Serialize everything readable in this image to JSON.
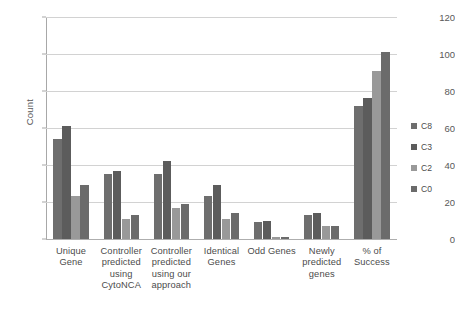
{
  "chart_data": {
    "type": "bar",
    "title": "",
    "xlabel": "",
    "ylabel": "Count",
    "ylim": [
      0,
      120
    ],
    "yticks": [
      0,
      20,
      40,
      60,
      80,
      100,
      120
    ],
    "grid": true,
    "legend_position": "right",
    "categories": [
      "Unique Gene",
      "Controller predicted using CytoNCA",
      "Controller predicted using our approach",
      "Identical Genes",
      "Odd Genes",
      "Newly predicted genes",
      "% of Success"
    ],
    "category_lines": [
      [
        "Unique",
        "Gene"
      ],
      [
        "Controller",
        "predicted",
        "using",
        "CytoNCA"
      ],
      [
        "Controller",
        "predicted",
        "using our",
        "approach"
      ],
      [
        "Identical",
        "Genes"
      ],
      [
        "Odd Genes"
      ],
      [
        "Newly",
        "predicted",
        "genes"
      ],
      [
        "% of",
        "Success"
      ]
    ],
    "series": [
      {
        "name": "C8",
        "color": "#6e6e6e",
        "values": [
          54,
          35,
          35,
          23,
          9,
          13,
          72
        ]
      },
      {
        "name": "C3",
        "color": "#5c5c5c",
        "values": [
          61,
          37,
          42,
          29,
          10,
          14,
          76
        ]
      },
      {
        "name": "C2",
        "color": "#999999",
        "values": [
          23,
          11,
          17,
          11,
          1,
          7,
          91
        ]
      },
      {
        "name": "C0",
        "color": "#6b6b6b",
        "values": [
          29,
          13,
          19,
          14,
          1,
          7,
          101
        ]
      }
    ]
  },
  "legend": {
    "items": [
      {
        "label": "C8",
        "color": "#6e6e6e"
      },
      {
        "label": "C3",
        "color": "#5c5c5c"
      },
      {
        "label": "C2",
        "color": "#999999"
      },
      {
        "label": "C0",
        "color": "#6b6b6b"
      }
    ]
  },
  "axes": {
    "y_label": "Count",
    "y_tick_labels": [
      "0",
      "20",
      "40",
      "60",
      "80",
      "100",
      "120"
    ]
  }
}
